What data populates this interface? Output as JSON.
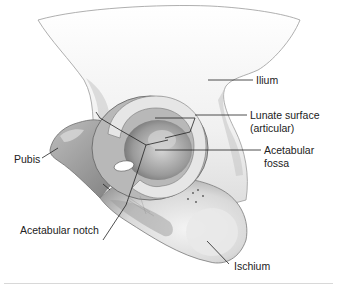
{
  "figure": {
    "labels": {
      "ilium": "Ilium",
      "lunate_surface_line1": "Lunate surface",
      "lunate_surface_line2": "(articular)",
      "acetabular_fossa_line1": "Acetabular",
      "acetabular_fossa_line2": "fossa",
      "pubis": "Pubis",
      "acetabular_notch": "Acetabular notch",
      "ischium": "Ischium"
    },
    "colors": {
      "bone_light": "#f2f2f2",
      "bone_mid": "#cfcfcf",
      "bone_shadow": "#8e8e8e",
      "leader_line": "#222222",
      "background": "#ffffff"
    }
  }
}
